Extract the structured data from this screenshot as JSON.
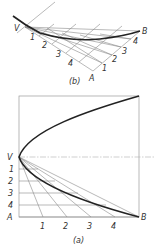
{
  "figure_b": {
    "caption": "(b)",
    "labels": {
      "vertex": "V",
      "end_b": "B",
      "end_a": "A",
      "divisions_va": [
        "1",
        "2",
        "3",
        "4"
      ],
      "divisions_ab": [
        "1",
        "2",
        "3",
        "4"
      ]
    }
  },
  "figure_a": {
    "caption": "(a)",
    "labels": {
      "vertex": "V",
      "end_b": "B",
      "end_a": "A",
      "divisions_vertical": [
        "1",
        "2",
        "3",
        "4"
      ],
      "divisions_horizontal": [
        "1",
        "2",
        "3",
        "4"
      ]
    }
  }
}
